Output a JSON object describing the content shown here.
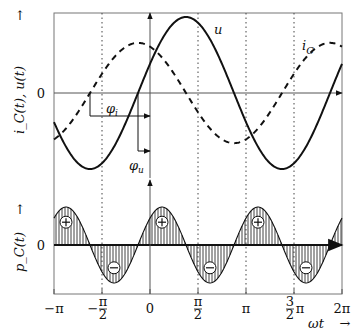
{
  "chart_data": [
    {
      "type": "line",
      "title": "",
      "ylabel": "i_C(t), u(t)",
      "ylabel_arrow": "↑",
      "ytick_labels": [
        "0"
      ],
      "x_range_rad_over_pi": [
        -1,
        2
      ],
      "series": [
        {
          "name": "u",
          "label": "u",
          "style": "solid",
          "amplitude": 1.0,
          "phase_over_pi": 0.125,
          "formula": "sin(ωt + φu)"
        },
        {
          "name": "i_C",
          "label": "i",
          "label_sub": "C",
          "style": "dashed",
          "amplitude": 0.66,
          "phase_over_pi": 0.625,
          "formula": "sin(ωt + φi)"
        }
      ],
      "annotations": [
        {
          "name": "phi_i",
          "label": "φ",
          "sub": "i",
          "from_over_pi": -0.625,
          "to_over_pi": 0
        },
        {
          "name": "phi_u",
          "label": "φ",
          "sub": "u",
          "from_over_pi": -0.125,
          "to_over_pi": 0
        }
      ],
      "grid": "dotted-vertical"
    },
    {
      "type": "area",
      "ylabel": "p_C(t)",
      "ylabel_arrow": "↑",
      "ytick_labels": [
        "0"
      ],
      "series": [
        {
          "name": "p_C",
          "formula": "u(t)·i_C(t) = −½cos(2ωt + 3π/4)",
          "amplitude": 0.5,
          "hatched": true
        }
      ],
      "sign_markers": [
        {
          "sign": "+",
          "x_over_pi": -0.875
        },
        {
          "sign": "−",
          "x_over_pi": -0.375
        },
        {
          "sign": "+",
          "x_over_pi": 0.125
        },
        {
          "sign": "−",
          "x_over_pi": 0.625
        },
        {
          "sign": "+",
          "x_over_pi": 1.125
        },
        {
          "sign": "−",
          "x_over_pi": 1.625
        }
      ],
      "xlabel": "ωt",
      "xlabel_arrow": "→",
      "xticks_over_pi": [
        -1,
        -0.5,
        0,
        0.5,
        1,
        1.5,
        2
      ],
      "xtick_labels": [
        "−π",
        "−π/2",
        "0",
        "π/2",
        "π",
        "3/2π",
        "2π"
      ]
    }
  ]
}
